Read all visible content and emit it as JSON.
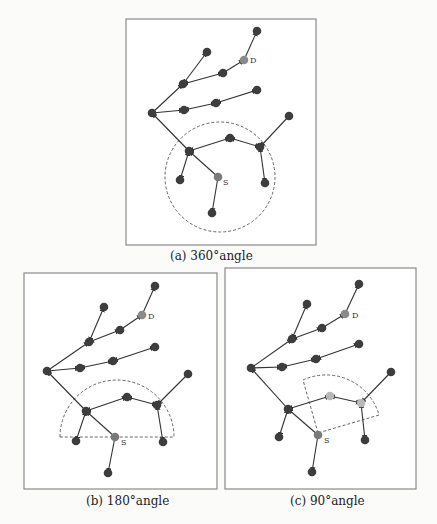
{
  "figure": {
    "panels": [
      {
        "id": "a",
        "caption": "(a) 360°angle",
        "label_S": "S",
        "label_D": "D",
        "range_shape": "circle"
      },
      {
        "id": "b",
        "caption": "(b) 180°angle",
        "label_S": "S",
        "label_D": "D",
        "range_shape": "semicircle"
      },
      {
        "id": "c",
        "caption": "(c) 90°angle",
        "label_S": "S",
        "label_D": "D",
        "range_shape": "quarter-sector"
      }
    ],
    "colors": {
      "node": "#3d3d3d",
      "source_node": "#7a7a7a",
      "destination_node": "#8a8a8a",
      "highlighted_node": "#b8b8b8",
      "edge": "#333333",
      "frame": "#8a8a8a"
    }
  }
}
